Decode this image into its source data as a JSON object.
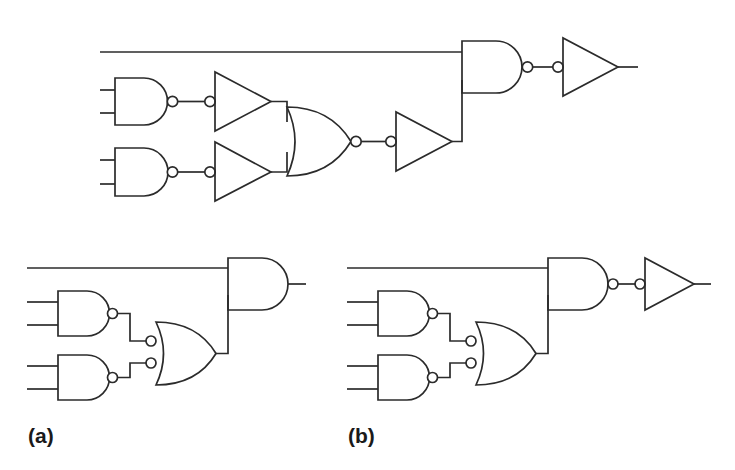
{
  "figure": {
    "background_color": "#ffffff",
    "line_color": "#2b2b2b",
    "bubble_fill": "#ffffff",
    "panels": [
      {
        "id": "top",
        "label": "",
        "description": "Top circuit: two NAND gates feeding two inverting buffers into a NOR-shaped gate, then an inverting buffer into a final NAND gate with a top input line, then a final inverting buffer.",
        "gate_count": 8,
        "gates": [
          {
            "name": "nand-top-left",
            "type": "NAND",
            "inputs": 2,
            "output_bubble": true
          },
          {
            "name": "nand-bottom-left",
            "type": "NAND",
            "inputs": 2,
            "output_bubble": true
          },
          {
            "name": "buffer-upper",
            "type": "BUFFER",
            "inputs": 1,
            "input_bubble": true
          },
          {
            "name": "buffer-lower",
            "type": "BUFFER",
            "inputs": 1,
            "input_bubble": true
          },
          {
            "name": "nor-middle",
            "type": "NOR",
            "inputs": 2,
            "output_bubble": true
          },
          {
            "name": "buffer-middle",
            "type": "BUFFER",
            "inputs": 1,
            "input_bubble": true
          },
          {
            "name": "nand-final",
            "type": "NAND",
            "inputs": 2,
            "output_bubble": true
          },
          {
            "name": "buffer-output",
            "type": "BUFFER",
            "inputs": 1,
            "input_bubble": true
          }
        ]
      },
      {
        "id": "a",
        "label": "(a)",
        "description": "Circuit (a): two NAND gates feeding an OR gate with two bubbled inputs, whose output feeds an AND gate together with a straight top line. AND output has no bubble.",
        "gate_count": 4,
        "gates": [
          {
            "name": "nand-top-left",
            "type": "NAND",
            "inputs": 2,
            "output_bubble": true
          },
          {
            "name": "nand-bottom-left",
            "type": "NAND",
            "inputs": 2,
            "output_bubble": true
          },
          {
            "name": "or-bubbled-inputs",
            "type": "OR",
            "inputs": 2,
            "input_bubbles": 2
          },
          {
            "name": "and-final",
            "type": "AND",
            "inputs": 2,
            "output_bubble": false
          }
        ]
      },
      {
        "id": "b",
        "label": "(b)",
        "description": "Circuit (b): same as (a) but the final gate is a NAND with an output bubble feeding a bubbled-input buffer triangle.",
        "gate_count": 5,
        "gates": [
          {
            "name": "nand-top-left",
            "type": "NAND",
            "inputs": 2,
            "output_bubble": true
          },
          {
            "name": "nand-bottom-left",
            "type": "NAND",
            "inputs": 2,
            "output_bubble": true
          },
          {
            "name": "or-bubbled-inputs",
            "type": "OR",
            "inputs": 2,
            "input_bubbles": 2
          },
          {
            "name": "nand-final",
            "type": "NAND",
            "inputs": 2,
            "output_bubble": true
          },
          {
            "name": "buffer-output",
            "type": "BUFFER",
            "inputs": 1,
            "input_bubble": true
          }
        ]
      }
    ]
  },
  "labels": {
    "panel_a": "(a)",
    "panel_b": "(b)"
  }
}
